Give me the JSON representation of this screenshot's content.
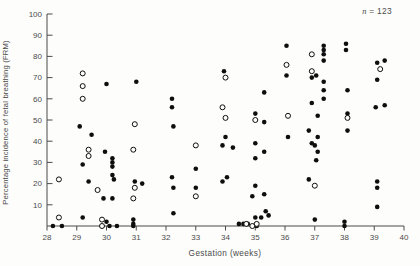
{
  "figure": {
    "note": {
      "n": "n",
      "rest": " = 123"
    }
  },
  "colors": {
    "axis": "#4a4a4a",
    "text": "#4a4a4a",
    "point": "#0e0e0e",
    "open_fill": "#fdfdfc",
    "background": "#fdfdfc"
  },
  "chart_data": {
    "type": "scatter",
    "title": "",
    "xlabel": "Gestation  (weeks)",
    "ylabel": "Percentage incidence of fetal breathing (FRM)",
    "annotation": "n = 123",
    "xlim": [
      28,
      40
    ],
    "ylim": [
      0,
      100
    ],
    "xticks": [
      28,
      29,
      30,
      31,
      32,
      33,
      34,
      35,
      36,
      37,
      38,
      39,
      40
    ],
    "yticks": [
      10,
      20,
      30,
      40,
      50,
      60,
      70,
      80,
      90,
      100
    ],
    "grid": false,
    "legend_position": "none",
    "series": [
      {
        "name": "filled",
        "marker": "filled-circle",
        "points": [
          [
            28.2,
            0
          ],
          [
            28.5,
            0
          ],
          [
            29.1,
            47
          ],
          [
            29.2,
            29
          ],
          [
            29.2,
            4
          ],
          [
            29.4,
            21
          ],
          [
            29.5,
            43
          ],
          [
            29.9,
            13
          ],
          [
            29.95,
            35
          ],
          [
            30.0,
            67
          ],
          [
            30.0,
            2
          ],
          [
            30.1,
            0
          ],
          [
            30.2,
            32
          ],
          [
            30.2,
            30
          ],
          [
            30.2,
            28
          ],
          [
            30.2,
            24
          ],
          [
            30.25,
            22
          ],
          [
            30.2,
            13
          ],
          [
            30.35,
            0
          ],
          [
            30.9,
            3
          ],
          [
            30.9,
            1
          ],
          [
            30.9,
            0
          ],
          [
            30.95,
            21
          ],
          [
            31.0,
            68
          ],
          [
            31.2,
            20
          ],
          [
            32.2,
            60
          ],
          [
            32.2,
            56
          ],
          [
            32.25,
            47
          ],
          [
            32.2,
            23
          ],
          [
            32.25,
            18
          ],
          [
            32.25,
            6
          ],
          [
            33.0,
            27
          ],
          [
            33.0,
            18
          ],
          [
            33.9,
            38
          ],
          [
            33.9,
            21
          ],
          [
            33.95,
            73
          ],
          [
            34.0,
            42
          ],
          [
            34.05,
            23
          ],
          [
            34.25,
            37
          ],
          [
            34.45,
            1
          ],
          [
            34.6,
            1
          ],
          [
            34.75,
            1
          ],
          [
            34.9,
            14
          ],
          [
            35.0,
            53
          ],
          [
            35.0,
            39
          ],
          [
            35.0,
            32
          ],
          [
            35.0,
            19
          ],
          [
            35.0,
            4
          ],
          [
            35.05,
            0
          ],
          [
            35.2,
            4
          ],
          [
            35.3,
            63
          ],
          [
            35.3,
            49
          ],
          [
            35.3,
            35
          ],
          [
            35.3,
            15
          ],
          [
            35.35,
            7
          ],
          [
            35.45,
            5
          ],
          [
            36.05,
            85
          ],
          [
            36.05,
            71
          ],
          [
            36.1,
            42
          ],
          [
            36.8,
            45
          ],
          [
            36.8,
            22
          ],
          [
            36.9,
            70
          ],
          [
            36.9,
            58
          ],
          [
            36.9,
            39
          ],
          [
            37.0,
            38
          ],
          [
            37.0,
            3
          ],
          [
            37.05,
            71
          ],
          [
            37.05,
            31
          ],
          [
            37.1,
            52
          ],
          [
            37.1,
            42
          ],
          [
            37.1,
            35
          ],
          [
            37.3,
            85
          ],
          [
            37.3,
            83
          ],
          [
            37.3,
            81
          ],
          [
            37.3,
            78
          ],
          [
            37.3,
            68
          ],
          [
            37.3,
            64
          ],
          [
            37.3,
            60
          ],
          [
            38.0,
            2
          ],
          [
            38.0,
            0
          ],
          [
            38.05,
            86
          ],
          [
            38.05,
            83
          ],
          [
            38.1,
            64
          ],
          [
            38.1,
            53
          ],
          [
            38.1,
            45
          ],
          [
            39.05,
            56
          ],
          [
            39.1,
            77
          ],
          [
            39.1,
            69
          ],
          [
            39.1,
            21
          ],
          [
            39.1,
            18
          ],
          [
            39.1,
            9
          ],
          [
            39.35,
            78
          ],
          [
            39.35,
            57
          ]
        ]
      },
      {
        "name": "open",
        "marker": "open-circle",
        "points": [
          [
            28.4,
            22
          ],
          [
            28.4,
            4
          ],
          [
            29.2,
            72
          ],
          [
            29.2,
            66
          ],
          [
            29.2,
            60
          ],
          [
            29.4,
            36
          ],
          [
            29.4,
            33
          ],
          [
            29.7,
            17
          ],
          [
            29.85,
            3
          ],
          [
            29.85,
            0
          ],
          [
            30.9,
            36
          ],
          [
            30.95,
            48
          ],
          [
            30.95,
            18
          ],
          [
            30.9,
            13
          ],
          [
            33.0,
            38
          ],
          [
            33.0,
            14
          ],
          [
            33.9,
            56
          ],
          [
            34.0,
            70
          ],
          [
            34.0,
            51
          ],
          [
            34.7,
            1
          ],
          [
            34.9,
            0
          ],
          [
            35.0,
            50
          ],
          [
            35.05,
            1
          ],
          [
            36.05,
            76
          ],
          [
            36.1,
            52
          ],
          [
            36.9,
            81
          ],
          [
            36.9,
            73
          ],
          [
            37.0,
            19
          ],
          [
            38.1,
            51
          ],
          [
            39.2,
            74
          ]
        ]
      }
    ]
  }
}
